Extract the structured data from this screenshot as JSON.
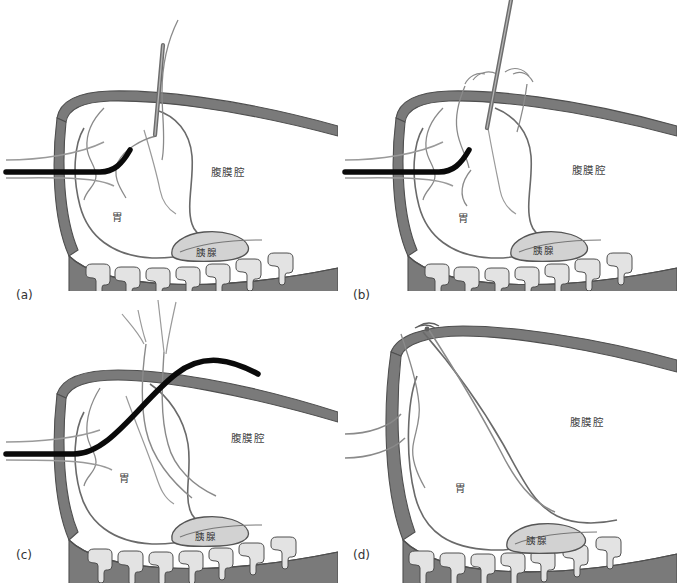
{
  "figure": {
    "title": "",
    "background_color": "#ffffff",
    "panel_count": 4
  },
  "colors": {
    "background": "#ffffff",
    "abdominal_wall": "#7a7a7a",
    "abdominal_wall_stroke": "#4f4f4f",
    "bowel_fill": "#e3e3e3",
    "bowel_stroke": "#4f4f4f",
    "organ_outline": "#5c5c5c",
    "pancreas_fill": "#d2d2d2",
    "pancreas_stroke": "#555555",
    "catheter": "#0a0a0a",
    "suture": "#6e6e6e",
    "needle_fill": "#9a9a9a",
    "needle_stroke": "#3a3a3a",
    "label_text": "#3d3d3d",
    "caption_text": "#333333"
  },
  "labels": {
    "peritoneal_cavity": "腹膜腔",
    "stomach": "胃",
    "pancreas": "胰腺"
  },
  "panels": [
    {
      "id": "a",
      "caption": "(a)",
      "labels": {
        "peritoneal_cavity": "腹膜腔",
        "stomach": "胃",
        "pancreas": "胰腺"
      },
      "elements": {
        "needle": "needle-through-abdominal-wall",
        "catheter": "black-endoscope-catheter-bent-up",
        "suture": "suture-thread-loop"
      }
    },
    {
      "id": "b",
      "caption": "(b)",
      "labels": {
        "peritoneal_cavity": "腹膜腔",
        "stomach": "胃",
        "pancreas": "胰腺"
      },
      "elements": {
        "needle": "needle-with-stitches",
        "catheter": "black-endoscope-catheter-bent-up",
        "suture": "suture-thread-stitched"
      }
    },
    {
      "id": "c",
      "caption": "(c)",
      "labels": {
        "peritoneal_cavity": "腹膜腔",
        "stomach": "胃",
        "pancreas": "胰腺"
      },
      "elements": {
        "catheter": "black-catheter-arched-over-top",
        "suture": "suture-threads-pulled-through"
      }
    },
    {
      "id": "d",
      "caption": "(d)",
      "labels": {
        "peritoneal_cavity": "腹膜腔",
        "stomach": "胃",
        "pancreas": "胰腺"
      },
      "elements": {
        "suture": "sutures-tied-off-at-wall"
      }
    }
  ]
}
